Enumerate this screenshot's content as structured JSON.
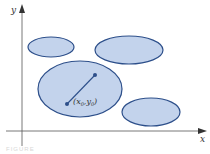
{
  "diagram": {
    "axes": {
      "x_label": "x",
      "y_label": "y",
      "color": "#555555"
    },
    "ellipses": [
      {
        "name": "small-top-left",
        "cx": 51,
        "cy": 47,
        "rx": 23,
        "ry": 10
      },
      {
        "name": "top-right",
        "cx": 129,
        "cy": 50,
        "rx": 34,
        "ry": 14
      },
      {
        "name": "large-center",
        "cx": 80,
        "cy": 89,
        "rx": 42,
        "ry": 28
      },
      {
        "name": "bottom-right",
        "cx": 151,
        "cy": 112,
        "rx": 29,
        "ry": 14
      }
    ],
    "vector": {
      "from": [
        67,
        104
      ],
      "to": [
        95,
        75
      ]
    },
    "point_label": {
      "x_part": "x",
      "x_sub": "0",
      "y_part": "y",
      "y_sub": "0"
    },
    "fill_color": "#c3d3ec",
    "stroke_color": "#2d4f8a",
    "caption": "FIGURE"
  }
}
